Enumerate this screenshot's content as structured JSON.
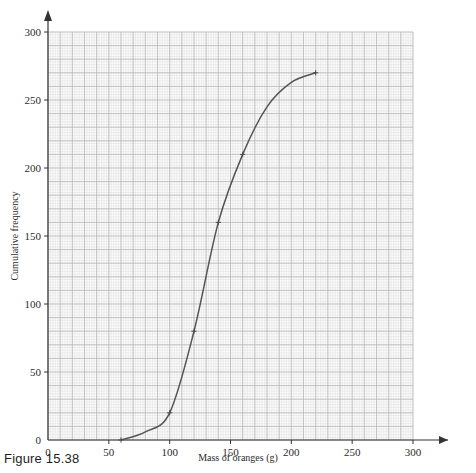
{
  "caption": "Figure 15.38",
  "chart_data": {
    "type": "line",
    "title": "",
    "subtitle": "",
    "xlabel": "Mass of oranges (g)",
    "ylabel": "Cumulative frequency",
    "xlim": [
      0,
      300
    ],
    "ylim": [
      0,
      300
    ],
    "x_ticks": [
      0,
      50,
      100,
      150,
      200,
      250,
      300
    ],
    "y_ticks": [
      0,
      50,
      100,
      150,
      200,
      250,
      300
    ],
    "x_tick_labels": [
      "0",
      "50",
      "100",
      "150",
      "200",
      "250",
      "300"
    ],
    "y_tick_labels": [
      "0",
      "50",
      "100",
      "150",
      "200",
      "250",
      "300"
    ],
    "grid": true,
    "grid_major_step": 10,
    "grid_minor_step": 2,
    "legend": false,
    "legend_position": "none",
    "curve_color": "#555555",
    "grid_major_color": "#b4b4b4",
    "grid_minor_color": "#dcdcdc",
    "axis_color": "#333333",
    "x": [
      60,
      80,
      100,
      120,
      140,
      160,
      180,
      200,
      220
    ],
    "y": [
      0,
      6,
      20,
      80,
      160,
      210,
      245,
      263,
      270
    ],
    "series": [
      {
        "name": "Cumulative frequency",
        "x": [
          60,
          80,
          100,
          120,
          140,
          160,
          180,
          200,
          220
        ],
        "values": [
          0,
          6,
          20,
          80,
          160,
          210,
          245,
          263,
          270
        ]
      }
    ],
    "markers": [
      {
        "x": 60,
        "y": 0
      },
      {
        "x": 100,
        "y": 20
      },
      {
        "x": 120,
        "y": 80
      },
      {
        "x": 140,
        "y": 160
      },
      {
        "x": 160,
        "y": 210
      },
      {
        "x": 220,
        "y": 270
      }
    ],
    "annotations": []
  }
}
